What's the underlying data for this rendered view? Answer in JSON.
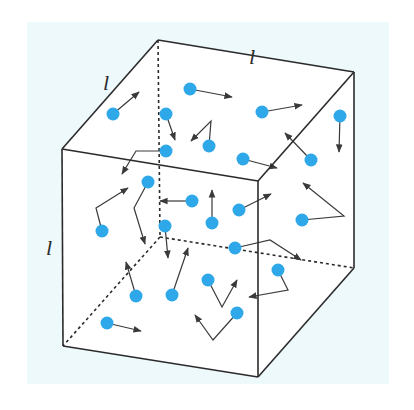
{
  "figure": {
    "colors": {
      "background": "#eef9fc",
      "cube_face": "#ffffff",
      "edge": "#2b2b2b",
      "particle": "#2fa8ea",
      "arrow": "#3a3a3a"
    },
    "edge_labels": [
      {
        "id": "top-back-edge",
        "text": "l",
        "x": 249,
        "y": 64
      },
      {
        "id": "left-top-edge",
        "text": "l",
        "x": 103,
        "y": 90
      },
      {
        "id": "front-left-edge",
        "text": "l",
        "x": 46,
        "y": 255
      }
    ],
    "cube": {
      "vertices": {
        "back_top_left": [
          158,
          40
        ],
        "back_top_right": [
          354,
          72
        ],
        "front_top_left": [
          62,
          149
        ],
        "front_top_right": [
          258,
          181
        ],
        "front_bottom_left": [
          63,
          346
        ],
        "front_bottom_right": [
          258,
          377
        ],
        "back_bottom_right": [
          354,
          268
        ],
        "back_bottom_left": [
          160,
          237
        ]
      }
    },
    "particles": [
      {
        "x": 113,
        "y": 114,
        "path": [
          [
            113,
            114
          ],
          [
            139,
            92
          ]
        ]
      },
      {
        "x": 190,
        "y": 89,
        "path": [
          [
            190,
            89
          ],
          [
            232,
            97
          ]
        ]
      },
      {
        "x": 166,
        "y": 114,
        "path": [
          [
            166,
            114
          ],
          [
            175,
            140
          ]
        ]
      },
      {
        "x": 209,
        "y": 146,
        "path": [
          [
            209,
            146
          ],
          [
            211,
            121
          ],
          [
            191,
            141
          ]
        ]
      },
      {
        "x": 262,
        "y": 112,
        "path": [
          [
            262,
            112
          ],
          [
            302,
            105
          ]
        ]
      },
      {
        "x": 340,
        "y": 116,
        "path": [
          [
            340,
            116
          ],
          [
            339,
            152
          ]
        ]
      },
      {
        "x": 166,
        "y": 151,
        "path": [
          [
            166,
            151
          ],
          [
            136,
            151
          ],
          [
            122,
            174
          ]
        ]
      },
      {
        "x": 243,
        "y": 159,
        "path": [
          [
            243,
            159
          ],
          [
            277,
            168
          ]
        ]
      },
      {
        "x": 311,
        "y": 160,
        "path": [
          [
            311,
            160
          ],
          [
            285,
            133
          ]
        ]
      },
      {
        "x": 148,
        "y": 182,
        "path": [
          [
            148,
            182
          ],
          [
            134,
            208
          ],
          [
            145,
            244
          ]
        ]
      },
      {
        "x": 192,
        "y": 201,
        "path": [
          [
            192,
            201
          ],
          [
            160,
            201
          ]
        ]
      },
      {
        "x": 239,
        "y": 210,
        "path": [
          [
            239,
            210
          ],
          [
            271,
            194
          ]
        ]
      },
      {
        "x": 302,
        "y": 220,
        "path": [
          [
            302,
            220
          ],
          [
            344,
            216
          ],
          [
            303,
            183
          ]
        ]
      },
      {
        "x": 102,
        "y": 231,
        "path": [
          [
            102,
            231
          ],
          [
            96,
            208
          ],
          [
            128,
            188
          ]
        ]
      },
      {
        "x": 212,
        "y": 223,
        "path": [
          [
            212,
            223
          ],
          [
            212,
            190
          ]
        ]
      },
      {
        "x": 165,
        "y": 226,
        "path": [
          [
            165,
            226
          ],
          [
            168,
            258
          ]
        ]
      },
      {
        "x": 235,
        "y": 248,
        "path": [
          [
            235,
            248
          ],
          [
            270,
            240
          ],
          [
            301,
            260
          ]
        ]
      },
      {
        "x": 278,
        "y": 270,
        "path": [
          [
            278,
            270
          ],
          [
            288,
            290
          ],
          [
            249,
            297
          ]
        ]
      },
      {
        "x": 136,
        "y": 296,
        "path": [
          [
            136,
            296
          ],
          [
            126,
            262
          ]
        ]
      },
      {
        "x": 172,
        "y": 295,
        "path": [
          [
            172,
            295
          ],
          [
            188,
            248
          ]
        ]
      },
      {
        "x": 208,
        "y": 280,
        "path": [
          [
            208,
            280
          ],
          [
            222,
            307
          ],
          [
            237,
            280
          ]
        ]
      },
      {
        "x": 237,
        "y": 313,
        "path": [
          [
            237,
            313
          ],
          [
            213,
            340
          ],
          [
            195,
            315
          ]
        ]
      },
      {
        "x": 107,
        "y": 323,
        "path": [
          [
            107,
            323
          ],
          [
            141,
            331
          ]
        ]
      }
    ]
  }
}
